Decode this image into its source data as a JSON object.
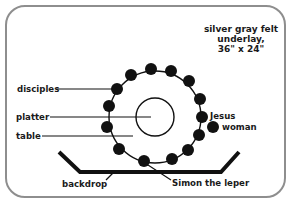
{
  "title": {
    "line1": "silver gray felt",
    "line2": "underlay,",
    "line3": "36\" x 24\""
  },
  "labels": {
    "disciples": "disciples",
    "platter": "platter",
    "table": "table",
    "jesus": "Jesus",
    "woman": "woman",
    "backdrop": "backdrop",
    "simon": "Simon the leper"
  },
  "colors": {
    "border": "#8e8e8e",
    "ink": "#111111",
    "background": "#ffffff"
  }
}
